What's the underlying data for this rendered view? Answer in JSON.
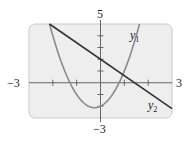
{
  "chart_data": {
    "type": "line",
    "title": "",
    "xlabel": "",
    "ylabel": "",
    "xlim": [
      -3,
      3
    ],
    "ylim": [
      -3,
      5
    ],
    "tick_labels": {
      "x_min": "−3",
      "x_max": "3",
      "y_min": "−3",
      "y_max": "5"
    },
    "x_ticks": [
      -2,
      -1,
      1,
      2
    ],
    "y_ticks": [
      -2,
      -1,
      1,
      2,
      3,
      4
    ],
    "grid": false,
    "series": [
      {
        "name": "y1",
        "label": "y",
        "subscript": "1",
        "kind": "parabola",
        "equation": "y = 2x^2 + x - 2",
        "points": [
          [
            -1.75,
            2.4
          ],
          [
            -1.28,
            0
          ],
          [
            -1,
            -1
          ],
          [
            -0.25,
            -2.125
          ],
          [
            0,
            -2
          ],
          [
            0.78,
            0
          ],
          [
            1.14,
            5
          ]
        ]
      },
      {
        "name": "y2",
        "label": "y",
        "subscript": "2",
        "kind": "line",
        "equation": "y = -1.4x + 2",
        "points": [
          [
            -2.14,
            5
          ],
          [
            0,
            2
          ],
          [
            1.43,
            0
          ],
          [
            3,
            -2.2
          ]
        ]
      }
    ],
    "colors": {
      "frame_fill": "#eeeeef",
      "frame_border": "#c8c8c8",
      "y1": "#8a8a8a",
      "y2": "#333333",
      "axis": "#666666"
    }
  }
}
